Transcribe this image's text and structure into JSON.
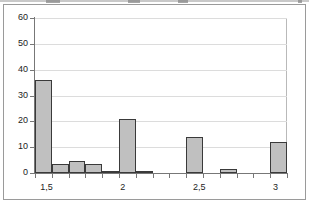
{
  "figure": {
    "frame_color": "#9a9a9a",
    "background": "#ffffff",
    "artifact_note": "scan-artifact-top-edge"
  },
  "chart_data": {
    "type": "bar",
    "title": "",
    "subtitle": "",
    "xlabel": "",
    "ylabel": "",
    "grid": true,
    "legend": null,
    "legend_position": "none",
    "bar_fill_color": "#c0c0c0",
    "bar_border_color": "#3a3a3a",
    "gridline_color": "#dcdcdc",
    "axis_color": "#777777",
    "ylim": [
      0,
      60
    ],
    "ytick_labels": [
      "0",
      "10",
      "20",
      "30",
      "40",
      "50",
      "60"
    ],
    "ytick_values": [
      0,
      10,
      20,
      30,
      40,
      50,
      60
    ],
    "xlim": [
      1.425,
      3.075
    ],
    "xtick_labels": [
      "1,5",
      "2",
      "2,5",
      "3"
    ],
    "xtick_values": [
      1.5,
      2.0,
      2.5,
      3.0
    ],
    "bin_width": 0.11,
    "categories": [
      "1,50",
      "1,61",
      "1,72",
      "1,83",
      "1,94",
      "2,05",
      "2,16",
      "2,27",
      "2,38",
      "2,49",
      "2,60",
      "2,71",
      "2,82",
      "2,93",
      "3,04"
    ],
    "values": [
      36,
      3.5,
      4.5,
      3.5,
      0.8,
      21,
      0.8,
      0,
      0,
      14,
      0,
      1.5,
      0,
      0,
      12
    ],
    "series": [
      {
        "name": "frequency",
        "values": [
          36,
          3.5,
          4.5,
          3.5,
          0.8,
          21,
          0.8,
          0,
          0,
          14,
          0,
          1.5,
          0,
          0,
          12
        ]
      }
    ]
  }
}
